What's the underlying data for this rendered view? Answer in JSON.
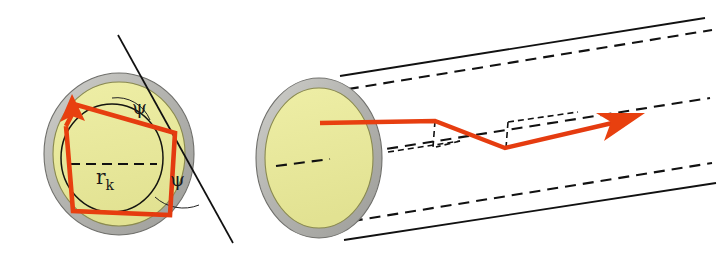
{
  "figure": {
    "background_color": "#ffffff"
  },
  "colors": {
    "core": "#e9e99b",
    "core_edge": "#8f8f52",
    "cladding": "#b6b6b2",
    "cladding_edge": "#7d7d79",
    "ray": "#ea3c13",
    "line": "#111111",
    "dash": "#111111",
    "label": "#1a1a1a"
  },
  "labels": {
    "radius": {
      "base": "r",
      "subscript": "k",
      "text": "r_k",
      "x": 96,
      "y": 181
    },
    "angle_upper": {
      "text": "ψ",
      "name": "psi",
      "x": 139,
      "y": 108
    },
    "angle_lower": {
      "text": "ψ",
      "name": "psi",
      "x": 176,
      "y": 180
    }
  },
  "left_view": {
    "name": "fiber-cross-section",
    "cladding_circle": {
      "cx": 119,
      "cy": 154,
      "rx": 75,
      "ry": 81
    },
    "core_circle": {
      "cx": 119,
      "cy": 154,
      "rx": 66,
      "ry": 72
    },
    "inner_caustic_circle": {
      "cx": 112,
      "cy": 158,
      "rx": 51,
      "ry": 54
    },
    "radius_dash": {
      "x1": 70,
      "y1": 164,
      "x2": 157,
      "y2": 164
    },
    "tangent_line": {
      "x1": 118,
      "y1": 35,
      "x2": 233,
      "y2": 243
    },
    "ray_polygon": [
      [
        66,
        126
      ],
      [
        77,
        105
      ],
      [
        175,
        133
      ],
      [
        170,
        215
      ],
      [
        73,
        211
      ],
      [
        66,
        126
      ]
    ],
    "ray_arrow_tip": {
      "x": 72,
      "y": 98
    }
  },
  "right_view": {
    "name": "fiber-3d-perspective",
    "end_face": {
      "cladding": {
        "cx": 319,
        "cy": 158,
        "rx": 63,
        "ry": 80
      },
      "core": {
        "cx": 319,
        "cy": 158,
        "rx": 54,
        "ry": 70
      }
    },
    "wall_top_solid": {
      "x1": 340,
      "y1": 76,
      "x2": 705,
      "y2": 18
    },
    "wall_bottom_solid": {
      "x1": 344,
      "y1": 240,
      "x2": 716,
      "y2": 183
    },
    "wall_top_dashed": {
      "x1": 330,
      "y1": 92,
      "x2": 712,
      "y2": 30
    },
    "wall_bottom_dashed": {
      "x1": 334,
      "y1": 224,
      "x2": 712,
      "y2": 163
    },
    "axis_dashed": {
      "x1": 275,
      "y1": 166,
      "x2": 710,
      "y2": 98
    },
    "core_axis_dash": {
      "x1": 275,
      "y1": 166,
      "x2": 316,
      "y2": 160
    },
    "ray_path": [
      [
        320,
        123
      ],
      [
        435,
        121
      ],
      [
        505,
        148
      ],
      [
        625,
        120
      ]
    ],
    "ray_arrow_tip": {
      "x": 641,
      "y": 116
    },
    "normal_marks": [
      {
        "x1": 435,
        "y1": 121,
        "x2": 433,
        "y2": 145
      },
      {
        "x1": 505,
        "y1": 148,
        "x2": 507,
        "y2": 125
      }
    ]
  },
  "icons": {
    "ray_arrow": "arrow-icon",
    "dashed_axis": "dashed-line-icon"
  }
}
